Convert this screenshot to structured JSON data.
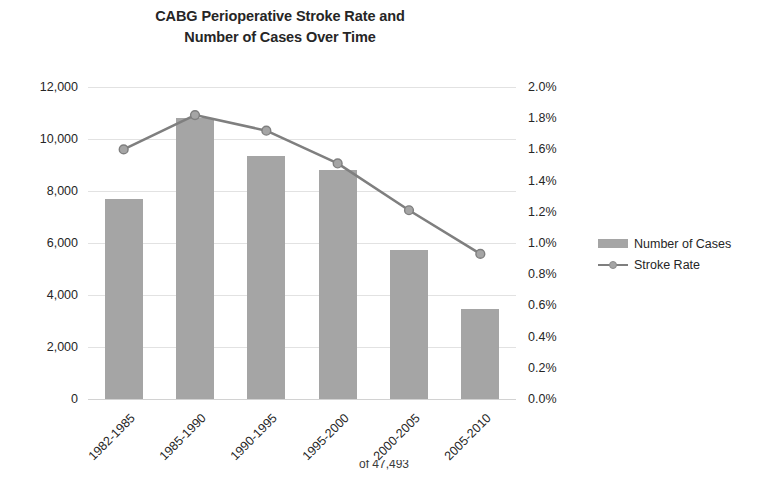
{
  "chart_data": {
    "type": "bar",
    "title": "CABG Perioperative Stroke Rate and Number of Cases Over Time",
    "title_lines": [
      "CABG Perioperative Stroke Rate and",
      "Number of Cases Over Time"
    ],
    "categories": [
      "1982-1985",
      "1985-1990",
      "1990-1995",
      "1995-2000",
      "2000-2005",
      "2005-2010"
    ],
    "series": [
      {
        "name": "Number of Cases",
        "type": "bar",
        "axis": "left",
        "color": "#a5a5a5",
        "values": [
          7700,
          10800,
          9350,
          8800,
          5730,
          3460
        ]
      },
      {
        "name": "Stroke Rate",
        "type": "line",
        "axis": "right",
        "color": "#7f7f7f",
        "values": [
          1.6,
          1.82,
          1.72,
          1.51,
          1.21,
          0.93
        ]
      }
    ],
    "xlabel": "",
    "ylabel": "",
    "y_left": {
      "min": 0,
      "max": 12000,
      "step": 2000,
      "ticks": [
        "0",
        "2,000",
        "4,000",
        "6,000",
        "8,000",
        "10,000",
        "12,000"
      ],
      "tick_values": [
        0,
        2000,
        4000,
        6000,
        8000,
        10000,
        12000
      ]
    },
    "y_right": {
      "min": 0,
      "max": 2.0,
      "step": 0.2,
      "ticks": [
        "0.0%",
        "0.2%",
        "0.4%",
        "0.6%",
        "0.8%",
        "1.0%",
        "1.2%",
        "1.4%",
        "1.6%",
        "1.8%",
        "2.0%"
      ],
      "tick_values": [
        0,
        0.2,
        0.4,
        0.6,
        0.8,
        1.0,
        1.2,
        1.4,
        1.6,
        1.8,
        2.0
      ]
    },
    "grid": true,
    "legend": {
      "position": "right",
      "entries": [
        {
          "label": "Number of Cases",
          "marker": "bar-swatch",
          "color": "#a5a5a5"
        },
        {
          "label": "Stroke Rate",
          "marker": "line-swatch",
          "color": "#7f7f7f"
        }
      ]
    }
  },
  "caption": {
    "text": "of 47,493"
  }
}
